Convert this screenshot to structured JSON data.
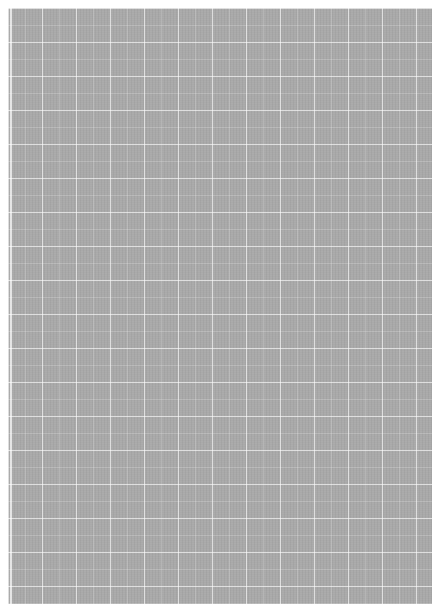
{
  "texture": {
    "type": "grid-paper",
    "base_color": "#a9a9a9",
    "grid_line_color": "#ffffff",
    "grid_spacing_px": 17,
    "background_color": "#ffffff"
  }
}
